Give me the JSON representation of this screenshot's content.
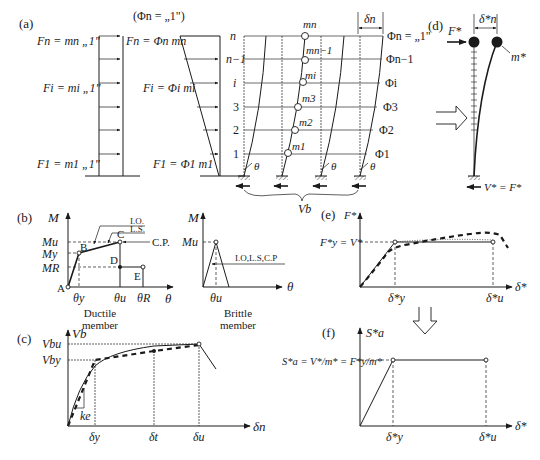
{
  "panels": {
    "a": {
      "label": "(a)",
      "phi_note": "(Φn = „1\")",
      "uniform_loads": [
        "Fn = mn „1\"",
        "Fi = mi „1\"",
        "F1 = m1 „1\""
      ],
      "modal_loads": [
        "Fn = Φn mn",
        "Fi = Φi mi",
        "F1 = Φ1 m1"
      ],
      "floor_labels": [
        "n",
        "n−1",
        "i",
        "3",
        "2",
        "1"
      ],
      "mass_labels": [
        "mn",
        "mn−1",
        "mi",
        "m3",
        "m2",
        "m1"
      ],
      "mode_labels": [
        "Φn = „1\"",
        "Φn−1",
        "Φi",
        "Φ3",
        "Φ2",
        "Φ1"
      ],
      "drift_label": "δn",
      "rotation_label": "θ",
      "base_shear_label": "Vb"
    },
    "b": {
      "label": "(b)",
      "ductile": {
        "y_axis": "M",
        "x_axis": "θ",
        "y_ticks": [
          "Mu",
          "My",
          "MR"
        ],
        "x_ticks": [
          "θy",
          "θu",
          "θR"
        ],
        "points": [
          "A",
          "B",
          "C",
          "D",
          "E"
        ],
        "performance": [
          "I.O.",
          "L.S.",
          "C.P."
        ],
        "caption": [
          "Ductile",
          "member"
        ]
      },
      "brittle": {
        "y_axis": "M",
        "x_axis": "θ",
        "y_ticks": [
          "Mu"
        ],
        "x_ticks": [
          "θu"
        ],
        "performance": "I.O,L.S,C.P",
        "caption": [
          "Brittle",
          "member"
        ]
      }
    },
    "c": {
      "label": "(c)",
      "y_axis": "Vb",
      "x_axis": "δn",
      "y_ticks": [
        "Vbu",
        "Vby"
      ],
      "x_ticks": [
        "δy",
        "δt",
        "δu"
      ],
      "stiffness_label": "ke"
    },
    "d": {
      "label": "(d)",
      "force_label": "F*",
      "mass_label": "m*",
      "drift_label": "δ*n",
      "base_label": "V* = F*"
    },
    "e": {
      "label": "(e)",
      "y_axis": "F*",
      "x_axis": "δ*",
      "y_ticks": [
        "F*y = V*"
      ],
      "x_ticks": [
        "δ*y",
        "δ*u"
      ]
    },
    "f": {
      "label": "(f)",
      "y_axis": "S*a",
      "x_axis": "δ*",
      "y_tick": "S*a = V*/m* = F*y/m*",
      "x_ticks": [
        "δ*y",
        "δ*u"
      ]
    }
  }
}
